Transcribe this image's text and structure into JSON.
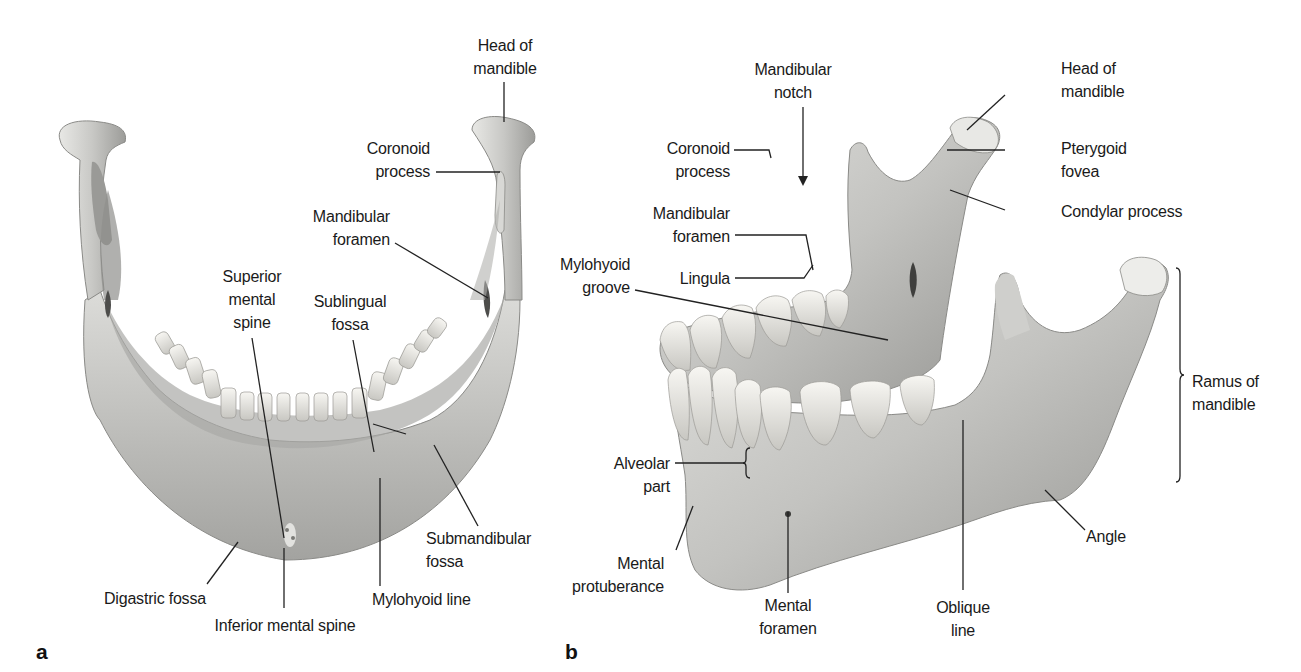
{
  "figure": {
    "title": "Mandible",
    "panels": [
      {
        "id": "a",
        "letter": "a",
        "view": "posterior view",
        "labels": {
          "head_of_mandible": "Head of\nmandible",
          "coronoid_process": "Coronoid\nprocess",
          "mandibular_foramen": "Mandibular\nforamen",
          "superior_mental_spine": "Superior\nmental\nspine",
          "sublingual_fossa": "Sublingual\nfossa",
          "submandibular_fossa": "Submandibular\nfossa",
          "mylohyoid_line": "Mylohyoid line",
          "digastric_fossa": "Digastric fossa",
          "inferior_mental_spine": "Inferior mental spine"
        }
      },
      {
        "id": "b",
        "letter": "b",
        "view": "left lateral oblique view",
        "labels": {
          "mandibular_notch": "Mandibular\nnotch",
          "head_of_mandible": "Head of\nmandible",
          "coronoid_process": "Coronoid\nprocess",
          "pterygoid_fovea": "Pterygoid\nfovea",
          "condylar_process": "Condylar process",
          "mandibular_foramen": "Mandibular\nforamen",
          "lingula": "Lingula",
          "mylohyoid_groove": "Mylohyoid\ngroove",
          "ramus_of_mandible": "Ramus of\nmandible",
          "alveolar_part": "Alveolar\npart",
          "mental_protuberance": "Mental\nprotuberance",
          "mental_foramen": "Mental\nforamen",
          "oblique_line": "Oblique\nline",
          "angle": "Angle"
        }
      }
    ],
    "colors": {
      "background": "#ffffff",
      "bone_light": "#ececea",
      "bone_mid": "#c9c9c6",
      "bone_dark": "#8f8f8c",
      "tooth": "#f2f1ec",
      "leader": "#222222",
      "text": "#1a1a1a"
    }
  }
}
